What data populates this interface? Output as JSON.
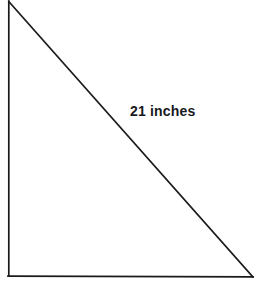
{
  "figure": {
    "kind": "right-triangle-diagram",
    "background_color": "#ffffff",
    "stroke_color": "#1a1a1a",
    "stroke_width": 1.6,
    "vertices": {
      "top_left_apex": [
        8,
        2
      ],
      "bottom_left_right_angle": [
        8,
        276
      ],
      "bottom_right": [
        253,
        277
      ]
    },
    "edges": [
      {
        "name": "vertical-leg",
        "from": [
          8,
          2
        ],
        "to": [
          8,
          276
        ]
      },
      {
        "name": "horizontal-leg",
        "from": [
          8,
          276
        ],
        "to": [
          253,
          277
        ]
      },
      {
        "name": "hypotenuse",
        "from": [
          8,
          2
        ],
        "to": [
          253,
          277
        ]
      }
    ],
    "labels": {
      "hypotenuse_value": "21",
      "hypotenuse_unit": "inches",
      "hypotenuse_full": "21 inches",
      "hypotenuse_text_color": "#17191c"
    }
  }
}
